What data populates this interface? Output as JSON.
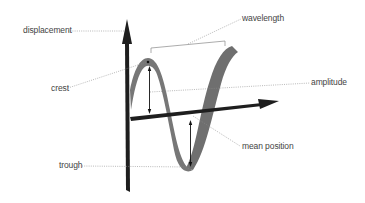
{
  "diagram": {
    "type": "transverse-wave",
    "colors": {
      "axis": "#1e1e1e",
      "ribbon": "#6e6e6e",
      "ribbon_dark": "#555555",
      "leader": "#888888",
      "label": "#444444"
    },
    "labels": {
      "displacement": "displacement",
      "wavelength": "wavelength",
      "crest": "crest",
      "amplitude": "amplitude",
      "trough": "trough",
      "mean_position": "mean position"
    }
  }
}
